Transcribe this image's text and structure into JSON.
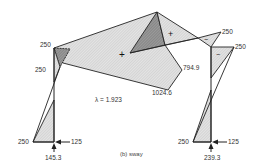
{
  "diagram": {
    "caption": "(b) sway",
    "load_factor": "λ = 1.923",
    "labels": {
      "left_top_corner": "250",
      "left_column_upper": "250",
      "left_base_moment": "250",
      "left_base_horizontal": "125",
      "left_base_vertical": "145.3",
      "right_top_beam": "250",
      "right_top_column": "250",
      "right_base_moment": "250",
      "right_base_horizontal": "125",
      "right_base_vertical": "239.3",
      "beam_value_upper": "794.9",
      "beam_value_lower": "1024.6"
    },
    "signs": {
      "beam_center": "+",
      "beam_right": "+",
      "right_beam_end": "−",
      "right_column_top": "−"
    },
    "colors": {
      "light_hatch": "#d6d6d6",
      "dark_hatch": "#8c8c8c",
      "line": "#222222"
    }
  }
}
